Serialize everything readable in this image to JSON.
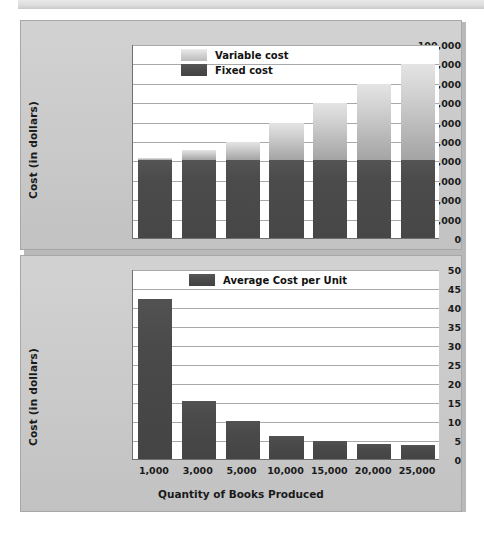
{
  "chart_data": [
    {
      "id": "total-cost",
      "type": "bar",
      "stacked": true,
      "title": "",
      "xlabel": "",
      "ylabel": "Cost (in dollars)",
      "categories": [
        "1,000",
        "3,000",
        "5,000",
        "10,000",
        "15,000",
        "20,000",
        "25,000"
      ],
      "ylim": [
        0,
        100000
      ],
      "ytick_step": 10000,
      "ytick_labels": [
        "0",
        "10,000",
        "20,000",
        "30,000",
        "40,000",
        "50,000",
        "60,000",
        "70,000",
        "80,000",
        "90,000",
        "100,000"
      ],
      "grid": true,
      "legend_position": "top-center",
      "series": [
        {
          "name": "Fixed cost",
          "color": "#4a4a4a",
          "values": [
            40000,
            40000,
            40000,
            40000,
            40000,
            40000,
            40000
          ]
        },
        {
          "name": "Variable cost",
          "color": "#c4c4c4",
          "values": [
            1500,
            5500,
            9500,
            19500,
            29500,
            39500,
            49500
          ]
        }
      ],
      "totals": [
        41500,
        45500,
        49500,
        59500,
        69500,
        79500,
        89500
      ]
    },
    {
      "id": "average-cost-per-unit",
      "type": "bar",
      "stacked": false,
      "title": "",
      "xlabel": "Quantity of Books Produced",
      "ylabel": "Cost (in dollars)",
      "categories": [
        "1,000",
        "3,000",
        "5,000",
        "10,000",
        "15,000",
        "20,000",
        "25,000"
      ],
      "ylim": [
        0,
        50
      ],
      "ytick_step": 5,
      "ytick_labels": [
        "0",
        "5",
        "10",
        "15",
        "20",
        "25",
        "30",
        "35",
        "40",
        "45",
        "50"
      ],
      "grid": true,
      "legend_position": "top-center",
      "series": [
        {
          "name": "Average Cost per Unit",
          "color": "#474747",
          "values": [
            42.0,
            15.3,
            10.0,
            6.0,
            4.7,
            4.0,
            3.6
          ]
        }
      ]
    }
  ]
}
